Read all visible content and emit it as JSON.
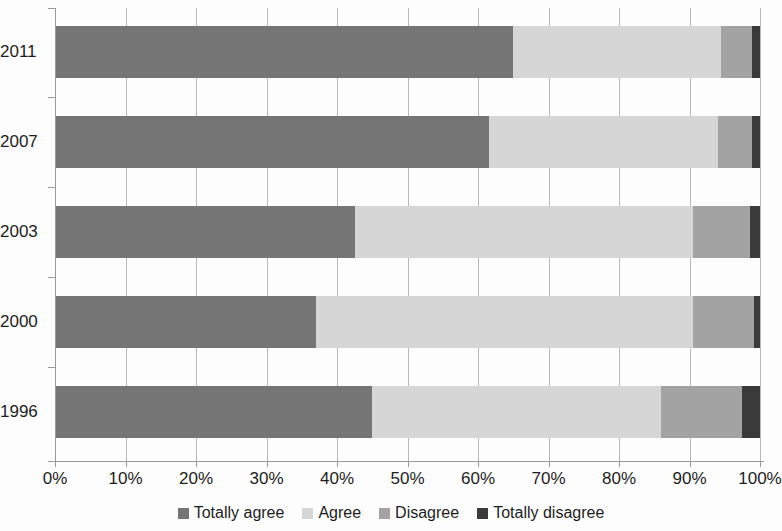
{
  "chart_data": {
    "type": "bar",
    "orientation": "horizontal",
    "stacked": true,
    "normalized_percent": true,
    "title": "",
    "subtitle": "",
    "xlabel": "",
    "ylabel": "",
    "xlim": [
      0,
      100
    ],
    "grid": true,
    "legend_position": "bottom",
    "categories": [
      "2011",
      "2007",
      "2003",
      "2000",
      "1996"
    ],
    "xticks": [
      "0%",
      "10%",
      "20%",
      "30%",
      "40%",
      "50%",
      "60%",
      "70%",
      "80%",
      "90%",
      "100%"
    ],
    "xtick_values": [
      0,
      10,
      20,
      30,
      40,
      50,
      60,
      70,
      80,
      90,
      100
    ],
    "series": [
      {
        "name": "Totally agree",
        "color": "#757575",
        "values": [
          65.0,
          61.5,
          42.5,
          37.0,
          45.0
        ]
      },
      {
        "name": "Agree",
        "color": "#d6d6d6",
        "values": [
          29.5,
          32.5,
          48.0,
          53.5,
          41.0
        ]
      },
      {
        "name": "Disagree",
        "color": "#a3a3a3",
        "values": [
          4.4,
          4.8,
          8.1,
          8.7,
          11.5
        ]
      },
      {
        "name": "Totally disagree",
        "color": "#3b3b3b",
        "values": [
          1.1,
          1.2,
          1.4,
          0.8,
          2.5
        ]
      }
    ]
  },
  "colors": {
    "totally_agree": "#757575",
    "agree": "#d6d6d6",
    "disagree": "#a3a3a3",
    "totally_disagree": "#3b3b3b",
    "gridline": "#b9b9b9",
    "axis": "#9a9a9a",
    "text": "#1d1d1d",
    "background": "#fdfdfd"
  }
}
